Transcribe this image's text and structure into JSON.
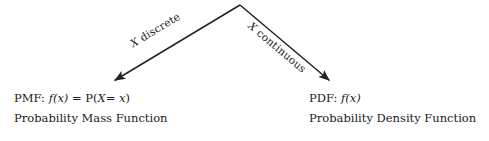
{
  "diagram": {
    "background_color": "#ffffff",
    "stroke_color": "#232323",
    "apex": {
      "x": 240,
      "y": 5
    },
    "branches": [
      {
        "id": "discrete",
        "label_prefix": "X",
        "label_text": " discrete",
        "label_full": "X discrete",
        "rotation_deg": -31,
        "arrow_from": {
          "x": 240,
          "y": 5
        },
        "arrow_to": {
          "x": 112,
          "y": 82
        }
      },
      {
        "id": "continuous",
        "label_prefix": "X",
        "label_text": " continuous",
        "label_full": "X continuous",
        "rotation_deg": 40,
        "arrow_from": {
          "x": 240,
          "y": 5
        },
        "arrow_to": {
          "x": 332,
          "y": 82
        }
      }
    ],
    "leaves": [
      {
        "id": "pmf",
        "abbrev": "PMF:",
        "func_letter": "f",
        "func_arg": "(x)",
        "equals": " = ",
        "prob_letter": "P",
        "prob_arg_open": "(",
        "prob_var": "X",
        "prob_eq": "= ",
        "prob_value": "x",
        "prob_arg_close": ")",
        "formula_plain": "PMF: f(x) = P(X= x)",
        "name": "Probability Mass Function"
      },
      {
        "id": "pdf",
        "abbrev": "PDF:",
        "func_letter": "f",
        "func_arg": "(x)",
        "formula_plain": "PDF: f(x)",
        "name": "Probability Density Function"
      }
    ]
  }
}
